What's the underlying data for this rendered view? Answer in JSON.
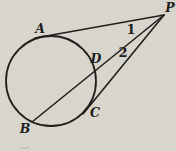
{
  "figure": {
    "canvas": {
      "width": 176,
      "height": 151
    },
    "colors": {
      "background": "#d8d5cd",
      "ink": "#201f1d",
      "smudge": "#a8a59c"
    },
    "circle": {
      "cx": 51,
      "cy": 81,
      "r": 45
    },
    "points": {
      "P": [
        164,
        15
      ],
      "A": [
        43,
        37
      ],
      "B": [
        32,
        122
      ],
      "C": [
        86,
        110
      ],
      "D": [
        95,
        71
      ]
    },
    "lines": [
      {
        "id": "tangent-line-PA",
        "from": [
          164,
          15
        ],
        "to": [
          35,
          38
        ]
      },
      {
        "id": "secant-line-PDB",
        "from": [
          164,
          15
        ],
        "to": [
          32,
          122
        ]
      },
      {
        "id": "tangent-line-PC",
        "from": [
          164,
          15
        ],
        "to": [
          83,
          114
        ]
      }
    ],
    "labels": [
      {
        "id": "P",
        "text": "P",
        "x": 170,
        "y": 12,
        "kind": "point-letter"
      },
      {
        "id": "A",
        "text": "A",
        "x": 40,
        "y": 33,
        "kind": "point-letter"
      },
      {
        "id": "B",
        "text": "B",
        "x": 25,
        "y": 133,
        "kind": "point-letter"
      },
      {
        "id": "C",
        "text": "C",
        "x": 95,
        "y": 117,
        "kind": "point-letter"
      },
      {
        "id": "D",
        "text": "D",
        "x": 96,
        "y": 63,
        "kind": "point-letter"
      },
      {
        "id": "angle-1",
        "text": "1",
        "x": 131,
        "y": 34,
        "kind": "angle-number"
      },
      {
        "id": "angle-2",
        "text": "2",
        "x": 123,
        "y": 57,
        "kind": "angle-number"
      }
    ],
    "artifact": {
      "path": "M 20 147 Q 24 150 29 147"
    },
    "stroke": {
      "line_width": 1.6,
      "circle_width": 1.8
    }
  }
}
